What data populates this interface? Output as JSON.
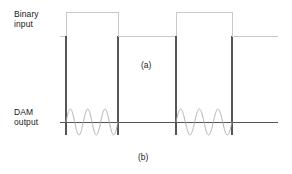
{
  "figure": {
    "labels": {
      "binary_input": "Binary\ninput",
      "dam_output": "DAM\noutput",
      "caption_a": "(a)",
      "caption_b": "(b)"
    },
    "colors": {
      "background": "#ffffff",
      "text": "#1a1a1a",
      "trace_dark": "#555555",
      "trace_light": "#c8c8c8",
      "trace_sine": "#a8a8a8"
    }
  },
  "chart_data": [
    {
      "type": "line",
      "name": "binary-input",
      "title": "Binary input",
      "panel": "(a)",
      "xlabel": "",
      "ylabel": "",
      "xlim": [
        60,
        278
      ],
      "ylim": [
        0,
        1
      ],
      "grid": false,
      "legend": "none",
      "waveform": "square",
      "baseline_y_px": 36,
      "high_y_px": 12,
      "x_start_px": 60,
      "x_end_px": 278,
      "pulses": [
        {
          "start_px": 66,
          "end_px": 118,
          "level": 1
        },
        {
          "start_px": 176,
          "end_px": 232,
          "level": 1
        }
      ],
      "x": [
        60,
        66,
        66,
        118,
        118,
        176,
        176,
        232,
        232,
        278
      ],
      "y": [
        0,
        0,
        1,
        1,
        0,
        0,
        1,
        1,
        0,
        0
      ]
    },
    {
      "type": "line",
      "name": "dam-output",
      "title": "DAM output",
      "panel": "(b)",
      "xlabel": "",
      "ylabel": "",
      "xlim": [
        60,
        278
      ],
      "ylim": [
        -1,
        1
      ],
      "grid": false,
      "legend": "none",
      "waveform": "sine-bursts",
      "baseline_y_px": 122,
      "amplitude_px": 13,
      "x_start_px": 60,
      "x_end_px": 278,
      "bursts": [
        {
          "start_px": 66,
          "end_px": 118,
          "cycles": 3
        },
        {
          "start_px": 176,
          "end_px": 232,
          "cycles": 3
        }
      ]
    }
  ]
}
